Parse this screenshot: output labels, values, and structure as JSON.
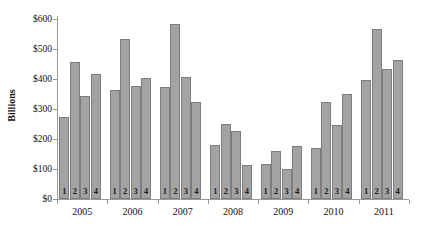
{
  "chart_data": {
    "type": "bar",
    "title": "",
    "subtitle": "",
    "xlabel": "",
    "ylabel": "Billions",
    "ylim": [
      0,
      600
    ],
    "ytick_values": [
      0,
      100,
      200,
      300,
      400,
      500,
      600
    ],
    "ytick_labels": [
      "$0",
      "$100",
      "$200",
      "$300",
      "$400",
      "$500",
      "$600"
    ],
    "grid": false,
    "legend": null,
    "legend_position": "none",
    "bar_color": "#a3a3a3",
    "bar_border_color": "#7d7d7d",
    "axis_color": "#9a9a9a",
    "categories": [
      "2005",
      "2006",
      "2007",
      "2008",
      "2009",
      "2010",
      "2011"
    ],
    "subcategories": [
      "1",
      "2",
      "3",
      "4"
    ],
    "groups": [
      {
        "label": "2005",
        "bars": [
          {
            "quarter": "1",
            "value": 275
          },
          {
            "quarter": "2",
            "value": 458
          },
          {
            "quarter": "3",
            "value": 344
          },
          {
            "quarter": "4",
            "value": 416
          }
        ]
      },
      {
        "label": "2006",
        "bars": [
          {
            "quarter": "1",
            "value": 363
          },
          {
            "quarter": "2",
            "value": 532
          },
          {
            "quarter": "3",
            "value": 378
          },
          {
            "quarter": "4",
            "value": 402
          }
        ]
      },
      {
        "label": "2007",
        "bars": [
          {
            "quarter": "1",
            "value": 374
          },
          {
            "quarter": "2",
            "value": 582
          },
          {
            "quarter": "3",
            "value": 408
          },
          {
            "quarter": "4",
            "value": 325
          }
        ]
      },
      {
        "label": "2008",
        "bars": [
          {
            "quarter": "1",
            "value": 180
          },
          {
            "quarter": "2",
            "value": 250
          },
          {
            "quarter": "3",
            "value": 227
          },
          {
            "quarter": "4",
            "value": 114
          }
        ]
      },
      {
        "label": "2009",
        "bars": [
          {
            "quarter": "1",
            "value": 118
          },
          {
            "quarter": "2",
            "value": 160
          },
          {
            "quarter": "3",
            "value": 100
          },
          {
            "quarter": "4",
            "value": 176
          }
        ]
      },
      {
        "label": "2010",
        "bars": [
          {
            "quarter": "1",
            "value": 170
          },
          {
            "quarter": "2",
            "value": 325
          },
          {
            "quarter": "3",
            "value": 247
          },
          {
            "quarter": "4",
            "value": 351
          }
        ]
      },
      {
        "label": "2011",
        "bars": [
          {
            "quarter": "1",
            "value": 397
          },
          {
            "quarter": "2",
            "value": 568
          },
          {
            "quarter": "3",
            "value": 434
          },
          {
            "quarter": "4",
            "value": 465
          }
        ]
      }
    ]
  }
}
